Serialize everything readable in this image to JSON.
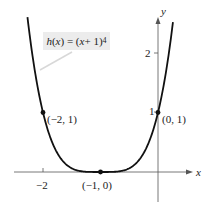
{
  "chart_data": {
    "type": "line",
    "title": "",
    "function_label": "h(x) = (x + 1)^4",
    "function_label_parts": {
      "fn": "h",
      "var": "x",
      "expr": "(x + 1)",
      "exp": "4"
    },
    "xlabel": "x",
    "ylabel": "y",
    "x_ticks": [
      {
        "value": -2,
        "label": "−2"
      }
    ],
    "y_ticks": [
      {
        "value": 1,
        "label": "1"
      },
      {
        "value": 2,
        "label": "2"
      }
    ],
    "xlim": [
      -2.5,
      0.6
    ],
    "ylim": [
      -0.5,
      2.6
    ],
    "grid": false,
    "series": [
      {
        "name": "h(x) = (x + 1)^4",
        "x": [
          -2.27,
          -2.2,
          -2.1,
          -2.0,
          -1.9,
          -1.8,
          -1.7,
          -1.6,
          -1.5,
          -1.4,
          -1.3,
          -1.2,
          -1.1,
          -1.0,
          -0.9,
          -0.8,
          -0.7,
          -0.6,
          -0.5,
          -0.4,
          -0.3,
          -0.2,
          -0.1,
          0.0,
          0.1,
          0.2,
          0.26
        ],
        "y": [
          2.6,
          2.07,
          1.46,
          1.0,
          0.656,
          0.41,
          0.24,
          0.13,
          0.0625,
          0.0256,
          0.0081,
          0.0016,
          0.0001,
          0.0,
          0.0001,
          0.0016,
          0.0081,
          0.0256,
          0.0625,
          0.13,
          0.24,
          0.41,
          0.656,
          1.0,
          1.46,
          2.07,
          2.52
        ]
      }
    ],
    "points": [
      {
        "x": -2,
        "y": 1,
        "label": "(−2, 1)"
      },
      {
        "x": -1,
        "y": 0,
        "label": "(−1, 0)"
      },
      {
        "x": 0,
        "y": 1,
        "label": "(0, 1)"
      }
    ]
  },
  "labels": {
    "x_axis": "x",
    "y_axis": "y",
    "tick_x_neg2": "−2",
    "tick_y_1": "1",
    "tick_y_2": "2",
    "pt_a": "(−2, 1)",
    "pt_b": "(−1, 0)",
    "pt_c": "(0, 1)",
    "eq_fn": "h",
    "eq_open": "(",
    "eq_var": "x",
    "eq_mid": ") = (",
    "eq_var2": "x",
    "eq_tail": " + 1)",
    "eq_exp": "4"
  }
}
